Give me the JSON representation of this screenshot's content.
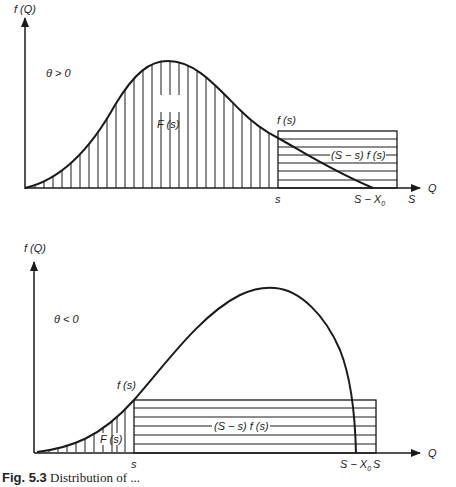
{
  "figure": {
    "caption_number": "Fig. 5.3",
    "caption_text": "Distribution of ..."
  },
  "top_panel": {
    "y_axis_label": "f (Q)",
    "x_axis_label": "Q",
    "condition_label": "θ > 0",
    "area_label": "F (s)",
    "point_label": "f (s)",
    "rect_label": "(S − s) f (s)",
    "tick_s": "s",
    "tick_s_minus_x0": "S − X",
    "tick_s_minus_x0_sub": "0",
    "tick_S": "S"
  },
  "bottom_panel": {
    "y_axis_label": "f (Q)",
    "x_axis_label": "Q",
    "condition_label": "θ < 0",
    "area_label": "F (s)",
    "point_label": "f (s)",
    "rect_label": "(S − s) f (s)",
    "tick_s": "s",
    "tick_s_minus_x0": "S − X",
    "tick_s_minus_x0_sub": "0",
    "tick_S": "S"
  },
  "colors": {
    "ink": "#1a1a1a",
    "paper": "#ffffff"
  }
}
